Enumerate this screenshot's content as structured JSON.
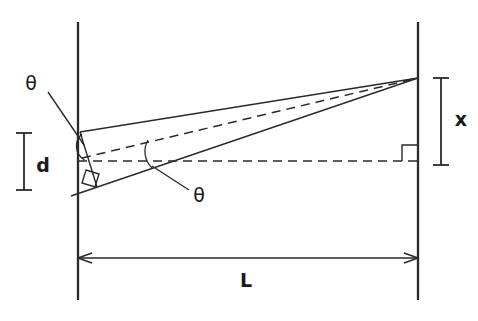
{
  "figure": {
    "kind": "geometry-diagram",
    "topic": "two-slit path-difference geometry",
    "background_color": "#ffffff",
    "line_color": "#2a2a2a",
    "text_color": "#1a1a1a"
  },
  "labels": {
    "theta_upper": "θ",
    "theta_lower": "θ",
    "slit_separation": "d",
    "fringe_offset": "x",
    "screen_distance": "L"
  },
  "geometry": {
    "canvas": {
      "width": 478,
      "height": 321
    },
    "slit_barrier": {
      "x": 78,
      "y_top": 22,
      "y_bottom": 300
    },
    "screen_barrier": {
      "x": 418,
      "y_top": 22,
      "y_bottom": 300
    },
    "slit_upper": {
      "x": 80,
      "y": 132
    },
    "slit_lower": {
      "x": 80,
      "y": 190
    },
    "slit_midpoint": {
      "x": 80,
      "y": 161
    },
    "apex": {
      "x": 418,
      "y": 78
    },
    "axis_dashed": {
      "x1": 78,
      "y1": 161,
      "x2": 418,
      "y2": 161
    },
    "bisector_dashed": {
      "x1": 80,
      "y1": 158,
      "x2": 418,
      "y2": 78
    },
    "ray_upper": {
      "x1": 80,
      "y1": 132,
      "x2": 418,
      "y2": 78
    },
    "ray_lower": {
      "x1": 72,
      "y1": 196,
      "x2": 418,
      "y2": 78
    },
    "slit_chord": {
      "x1": 80,
      "y1": 132,
      "x2": 96,
      "y2": 186
    },
    "d_bracket": {
      "x": 24,
      "y_top": 133,
      "y_bottom": 190
    },
    "x_bracket": {
      "x": 441,
      "y_top": 78,
      "y_bottom": 165
    },
    "L_arrow": {
      "y": 258,
      "x1": 78,
      "x2": 418
    },
    "right_angle_screen": {
      "x": 402,
      "y": 146,
      "size": 15
    },
    "right_angle_slit": {
      "cx": 94,
      "cy": 178,
      "size": 13,
      "rotation_deg": -19
    },
    "angle_arc_slit": {
      "cx": 80,
      "cy": 146,
      "radius": 14
    },
    "angle_arc_axis": {
      "cx": 152,
      "cy": 162,
      "radius": 22
    }
  },
  "label_positions": {
    "theta_upper": {
      "x": 31,
      "y": 90
    },
    "theta_lower": {
      "x": 193,
      "y": 201
    },
    "slit_separation": {
      "x": 36,
      "y": 171
    },
    "fringe_offset": {
      "x": 456,
      "y": 126
    },
    "screen_distance": {
      "x": 242,
      "y": 285
    }
  },
  "leader_lines": {
    "theta_upper": {
      "x1": 48,
      "y1": 92,
      "x2": 84,
      "y2": 144
    },
    "theta_lower": {
      "x1": 189,
      "y1": 190,
      "x2": 152,
      "y2": 166
    }
  }
}
